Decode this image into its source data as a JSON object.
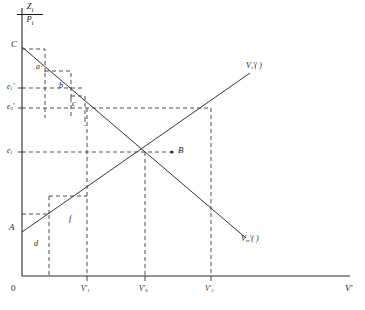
{
  "figure": {
    "type": "economics-supply-demand-diagram",
    "axes": {
      "y_axis_numerator": "Z",
      "y_axis_numerator_sub": "i",
      "y_axis_denominator": "P",
      "y_axis_denominator_sub": "i",
      "y_axis_label_full": "Z_i / P_i",
      "x_axis_label": "V",
      "x_axis_label_prime": "′",
      "origin_label": "0"
    },
    "x_ticks": [
      {
        "label": "V",
        "sub": "1",
        "prime": "′",
        "x_px": 87
      },
      {
        "label": "V",
        "sub": "0",
        "prime": "′",
        "x_px": 145
      },
      {
        "label": "V",
        "sub": "2",
        "prime": "′",
        "x_px": 211
      }
    ],
    "y_ticks": [
      {
        "label": "e",
        "sub": "1",
        "prime": "′",
        "y_px": 88
      },
      {
        "label": "e",
        "sub": "0",
        "prime": "′",
        "y_px": 108
      },
      {
        "label": "e",
        "sub": "1",
        "prime": "",
        "y_px": 152
      }
    ],
    "curves": [
      {
        "name": "supply-curve",
        "label_base": "V",
        "label_sub": "s",
        "label_prime": "′",
        "label_tail": "(   )",
        "direction": "upward-sloping",
        "from": {
          "x": 22,
          "y": 232
        },
        "to": {
          "x": 250,
          "y": 73
        },
        "label_pos": {
          "x": 248,
          "y": 65
        }
      },
      {
        "name": "demand-curve",
        "label_base": "V",
        "label_sub": "m",
        "label_prime": "′",
        "label_tail": "(   )",
        "direction": "downward-sloping",
        "from": {
          "x": 22,
          "y": 47
        },
        "to": {
          "x": 246,
          "y": 238
        },
        "label_pos": {
          "x": 243,
          "y": 238
        }
      }
    ],
    "points": [
      {
        "label": "C",
        "x": 14,
        "y": 46,
        "desc": "demand-intercept"
      },
      {
        "label": "A",
        "x": 11,
        "y": 229,
        "desc": "supply-intercept"
      },
      {
        "label": "B",
        "x": 180,
        "y": 152,
        "desc": "equilibrium-point"
      }
    ],
    "region_labels": [
      {
        "label": "a",
        "x": 38,
        "y": 68
      },
      {
        "label": "b",
        "x": 61,
        "y": 87
      },
      {
        "label": "c",
        "x": 74,
        "y": 104
      },
      {
        "label": "d",
        "x": 36,
        "y": 244
      },
      {
        "label": "f",
        "x": 71,
        "y": 219
      }
    ]
  }
}
